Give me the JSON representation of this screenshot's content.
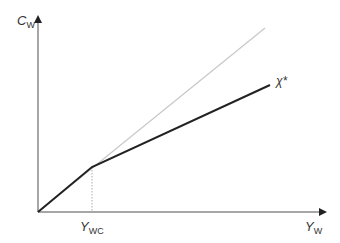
{
  "diagram": {
    "y_axis": {
      "label_main": "C",
      "label_sub": "W"
    },
    "x_axis": {
      "label_main": "Y",
      "label_sub": "W"
    },
    "kink_label": {
      "main": "Y",
      "sub": "WC"
    },
    "curve_label": "χ*",
    "lines": [
      {
        "name": "45-degree reference line",
        "color": "#c8c8c8",
        "from": [
          38,
          212
        ],
        "to": [
          265,
          28
        ]
      },
      {
        "name": "consumption function chi-star",
        "color": "#222222",
        "segments": [
          [
            38,
            212
          ],
          [
            92,
            167
          ],
          [
            270,
            85
          ]
        ]
      },
      {
        "name": "Y_WC dotted guide",
        "color": "#aaaaaa",
        "style": "dotted",
        "from": [
          92,
          167
        ],
        "to": [
          92,
          212
        ]
      }
    ],
    "colors": {
      "axis": "#888888",
      "curve": "#222222",
      "reference": "#c8c8c8"
    }
  }
}
